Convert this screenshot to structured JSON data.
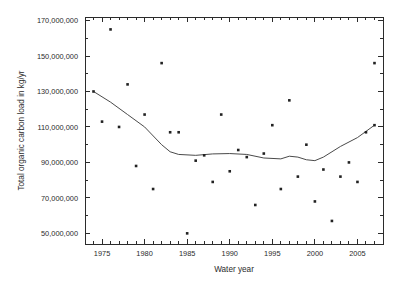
{
  "chart_data": {
    "type": "scatter",
    "title": "",
    "xlabel": "Water year",
    "ylabel": "Total organic carbon load in kg/yr",
    "xlim": [
      1973,
      2008
    ],
    "ylim": [
      44000000,
      172000000
    ],
    "grid": false,
    "legend": "none",
    "x_major_ticks": [
      1975,
      1980,
      1985,
      1990,
      1995,
      2000,
      2005
    ],
    "x_tick_labels": [
      "1975",
      "1980",
      "1985",
      "1990",
      "1995",
      "2000",
      "2005"
    ],
    "x_minor_tick_step": 1,
    "y_major_ticks": [
      50000000,
      70000000,
      90000000,
      110000000,
      130000000,
      150000000,
      170000000
    ],
    "y_tick_labels": [
      "50,000,000",
      "70,000,000",
      "90,000,000",
      "110,000,000",
      "130,000,000",
      "150,000,000",
      "170,000,000"
    ],
    "y_minor_tick_step": 10000000,
    "series": [
      {
        "name": "Annual TOC load",
        "type": "scatter",
        "marker": "square",
        "color": "#222222",
        "points": [
          {
            "x": 1974,
            "y": 130000000
          },
          {
            "x": 1975,
            "y": 113000000
          },
          {
            "x": 1976,
            "y": 165000000
          },
          {
            "x": 1977,
            "y": 110000000
          },
          {
            "x": 1978,
            "y": 134000000
          },
          {
            "x": 1979,
            "y": 88000000
          },
          {
            "x": 1980,
            "y": 117000000
          },
          {
            "x": 1981,
            "y": 75000000
          },
          {
            "x": 1982,
            "y": 146000000
          },
          {
            "x": 1983,
            "y": 107000000
          },
          {
            "x": 1984,
            "y": 107000000
          },
          {
            "x": 1985,
            "y": 50000000
          },
          {
            "x": 1986,
            "y": 91000000
          },
          {
            "x": 1987,
            "y": 94000000
          },
          {
            "x": 1988,
            "y": 79000000
          },
          {
            "x": 1989,
            "y": 117000000
          },
          {
            "x": 1990,
            "y": 85000000
          },
          {
            "x": 1991,
            "y": 97000000
          },
          {
            "x": 1992,
            "y": 93000000
          },
          {
            "x": 1993,
            "y": 66000000
          },
          {
            "x": 1994,
            "y": 95000000
          },
          {
            "x": 1995,
            "y": 111000000
          },
          {
            "x": 1996,
            "y": 75000000
          },
          {
            "x": 1997,
            "y": 125000000
          },
          {
            "x": 1998,
            "y": 82000000
          },
          {
            "x": 1999,
            "y": 100000000
          },
          {
            "x": 2000,
            "y": 68000000
          },
          {
            "x": 2001,
            "y": 86000000
          },
          {
            "x": 2002,
            "y": 57000000
          },
          {
            "x": 2003,
            "y": 82000000
          },
          {
            "x": 2004,
            "y": 90000000
          },
          {
            "x": 2005,
            "y": 79000000
          },
          {
            "x": 2006,
            "y": 107000000
          },
          {
            "x": 2007,
            "y": 146000000
          },
          {
            "x": 2007,
            "y": 111000000
          }
        ]
      },
      {
        "name": "Smoothed trend",
        "type": "line",
        "color": "#4a4a4a",
        "points": [
          {
            "x": 1974,
            "y": 130000000
          },
          {
            "x": 1976,
            "y": 124000000
          },
          {
            "x": 1978,
            "y": 117000000
          },
          {
            "x": 1980,
            "y": 110000000
          },
          {
            "x": 1982,
            "y": 100000000
          },
          {
            "x": 1983,
            "y": 96000000
          },
          {
            "x": 1984,
            "y": 94500000
          },
          {
            "x": 1986,
            "y": 94000000
          },
          {
            "x": 1988,
            "y": 94800000
          },
          {
            "x": 1990,
            "y": 95000000
          },
          {
            "x": 1992,
            "y": 94500000
          },
          {
            "x": 1994,
            "y": 92500000
          },
          {
            "x": 1996,
            "y": 92000000
          },
          {
            "x": 1997,
            "y": 93500000
          },
          {
            "x": 1998,
            "y": 93000000
          },
          {
            "x": 1999,
            "y": 91500000
          },
          {
            "x": 2000,
            "y": 91000000
          },
          {
            "x": 2001,
            "y": 93000000
          },
          {
            "x": 2003,
            "y": 99000000
          },
          {
            "x": 2005,
            "y": 104000000
          },
          {
            "x": 2007,
            "y": 111000000
          }
        ]
      }
    ]
  }
}
